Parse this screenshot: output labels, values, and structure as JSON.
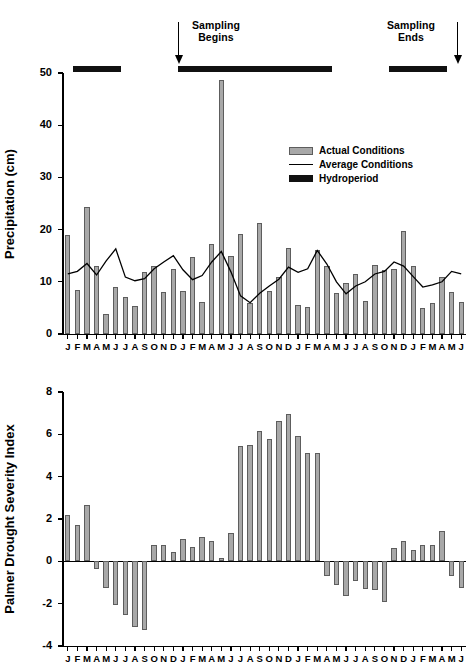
{
  "figure": {
    "annotations": [
      {
        "id": "sampling-begins",
        "line1": "Sampling",
        "line2": "Begins"
      },
      {
        "id": "sampling-ends",
        "line1": "Sampling",
        "line2": "Ends"
      }
    ],
    "legend": [
      {
        "key": "actual",
        "label": "Actual Conditions",
        "swatch": "filled-bar",
        "color": "#a8a8a8"
      },
      {
        "key": "average",
        "label": "Average Conditions",
        "swatch": "line",
        "color": "#000000"
      },
      {
        "key": "hydroperiod",
        "label": "Hydroperiod",
        "swatch": "filled-bar",
        "color": "#111111"
      }
    ],
    "hydroperiod_spans": [
      {
        "start_index": 1,
        "end_index": 5
      },
      {
        "start_index": 12,
        "end_index": 27
      },
      {
        "start_index": 34,
        "end_index": 39
      }
    ]
  },
  "chart_data": [
    {
      "id": "precipitation-chart",
      "type": "bar",
      "title": "",
      "xlabel": "",
      "ylabel": "Precipitation (cm)",
      "ylim": [
        0,
        50
      ],
      "yticks": [
        0,
        10,
        20,
        30,
        40,
        50
      ],
      "grid": false,
      "legend_position": "upper-right-inside",
      "categories": [
        "J",
        "F",
        "M",
        "A",
        "M",
        "J",
        "J",
        "A",
        "S",
        "O",
        "N",
        "D",
        "J",
        "F",
        "M",
        "A",
        "M",
        "J",
        "J",
        "A",
        "S",
        "O",
        "N",
        "D",
        "J",
        "F",
        "M",
        "A",
        "M",
        "J",
        "J",
        "A",
        "S",
        "O",
        "N",
        "D",
        "J",
        "F",
        "M",
        "A",
        "M",
        "J"
      ],
      "series": [
        {
          "name": "Actual Conditions",
          "type": "bar",
          "color": "#a8a8a8",
          "values": [
            19.0,
            8.5,
            24.3,
            13.0,
            3.8,
            9.0,
            7.0,
            5.3,
            11.8,
            13.0,
            8.0,
            12.5,
            8.3,
            14.8,
            6.2,
            17.3,
            48.7,
            15.0,
            19.2,
            6.0,
            21.2,
            8.3,
            11.0,
            16.5,
            5.5,
            5.2,
            16.0,
            13.0,
            7.8,
            9.7,
            11.5,
            6.3,
            13.2,
            12.2,
            12.5,
            19.8,
            13.0,
            5.0,
            6.0,
            11.0,
            8.0,
            6.2
          ]
        },
        {
          "name": "Average Conditions",
          "type": "line",
          "color": "#000000",
          "values": [
            11.5,
            12.0,
            13.5,
            11.3,
            14.0,
            16.3,
            10.9,
            10.2,
            10.6,
            12.5,
            13.8,
            15.0,
            12.3,
            10.4,
            11.2,
            13.8,
            15.8,
            11.9,
            7.3,
            6.0,
            7.8,
            9.2,
            10.5,
            12.8,
            11.8,
            12.5,
            16.0,
            13.4,
            10.0,
            7.7,
            9.2,
            10.0,
            11.5,
            12.0,
            13.8,
            13.0,
            11.0,
            9.0,
            9.4,
            10.0,
            12.0,
            11.5
          ]
        }
      ]
    },
    {
      "id": "palmer-drought-chart",
      "type": "bar",
      "title": "",
      "xlabel": "",
      "ylabel": "Palmer Drought Severity Index",
      "ylim": [
        -4,
        8
      ],
      "yticks": [
        -4,
        -2,
        0,
        2,
        4,
        6,
        8
      ],
      "grid": false,
      "zero_line": 0,
      "categories": [
        "J",
        "F",
        "M",
        "A",
        "M",
        "J",
        "J",
        "A",
        "S",
        "O",
        "N",
        "D",
        "J",
        "F",
        "M",
        "A",
        "M",
        "J",
        "J",
        "A",
        "S",
        "O",
        "N",
        "D",
        "J",
        "F",
        "M",
        "A",
        "M",
        "J",
        "J",
        "A",
        "S",
        "O",
        "N",
        "D",
        "J",
        "F",
        "M",
        "A",
        "M",
        "J"
      ],
      "series": [
        {
          "name": "Palmer Drought Severity Index",
          "type": "bar",
          "color": "#a8a8a8",
          "values": [
            2.2,
            1.7,
            2.65,
            -0.35,
            -1.25,
            -2.05,
            -2.55,
            -3.1,
            -3.25,
            0.75,
            0.75,
            0.45,
            1.05,
            0.7,
            1.15,
            0.95,
            0.15,
            1.35,
            5.45,
            5.5,
            6.15,
            5.8,
            6.65,
            6.95,
            5.9,
            5.1,
            5.1,
            -0.7,
            -1.1,
            -1.65,
            -0.95,
            -1.3,
            -1.35,
            -1.9,
            0.65,
            0.95,
            0.55,
            0.75,
            0.75,
            1.45,
            -0.7,
            -1.25
          ]
        }
      ]
    }
  ]
}
